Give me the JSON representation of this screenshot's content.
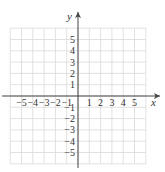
{
  "chart_data": {
    "type": "scatter",
    "title": "",
    "xlabel": "x",
    "ylabel": "y",
    "xlim": [
      -6,
      6
    ],
    "ylim": [
      -6,
      6
    ],
    "grid": true,
    "x_ticks": [
      -5,
      -4,
      -3,
      -2,
      -1,
      1,
      2,
      3,
      4,
      5
    ],
    "y_ticks": [
      5,
      4,
      3,
      2,
      1,
      -1,
      -2,
      -3,
      -4,
      -5
    ],
    "x_tick_labels": [
      "−5",
      "−4",
      "−3",
      "−2",
      "−1",
      "1",
      "2",
      "3",
      "4",
      "5"
    ],
    "y_tick_labels": [
      "5",
      "4",
      "3",
      "2",
      "1",
      "−1",
      "−2",
      "−3",
      "−4",
      "−5"
    ],
    "series": [],
    "legend": null
  },
  "colors": {
    "grid": "#d9d9d9",
    "axis": "#444444",
    "text": "#333333"
  },
  "layout": {
    "origin_x": 78,
    "origin_y": 96,
    "unit": 11.3,
    "grid_left": 10,
    "grid_right": 146,
    "grid_top": 28,
    "grid_bottom": 164
  }
}
